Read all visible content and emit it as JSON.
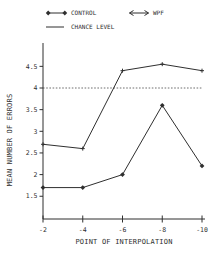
{
  "figure": {
    "background": "#ffffff",
    "ink": "#2f2f2f",
    "chance_line_color": "#6e6e6e"
  },
  "chart_data": {
    "type": "line",
    "title": "",
    "xlabel": "POINT OF INTERPOLATION",
    "ylabel": "MEAN NUMBER OF ERRORS",
    "x_tick_labels": [
      "-2",
      "-4",
      "-6",
      "-8",
      "-10"
    ],
    "y_ticks": [
      1.5,
      2,
      2.5,
      3,
      3.5,
      4,
      4.5
    ],
    "ylim": [
      1.0,
      5.0
    ],
    "grid": false,
    "legend_position": "top",
    "chance_level": 4.0,
    "chance_label": "CHANCE LEVEL",
    "series": [
      {
        "name": "CONTROL",
        "marker": "diamond",
        "values": [
          1.7,
          1.7,
          2.0,
          3.6,
          2.2
        ]
      },
      {
        "name": "WPF",
        "marker": "plus",
        "values": [
          2.7,
          2.6,
          4.4,
          4.55,
          4.4
        ]
      }
    ]
  }
}
